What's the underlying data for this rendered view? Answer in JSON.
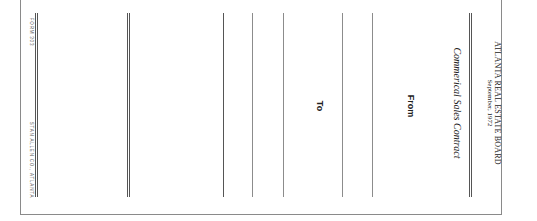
{
  "header": {
    "organization": "ATLANTA REAL ESTATE BOARD",
    "date": "September, 1972",
    "title": "Commerical Sales Contract"
  },
  "fields": {
    "from_label": "From",
    "to_label": "To"
  },
  "footer": {
    "form_number": "FORM 303",
    "printer": "STAN ALLEN CO., ATLANTA"
  }
}
